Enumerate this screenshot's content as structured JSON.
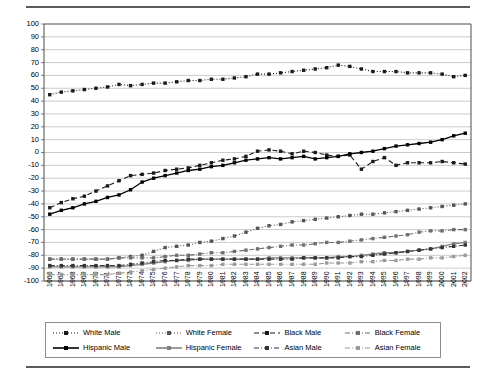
{
  "chart_data": {
    "type": "line",
    "title": "",
    "xlabel": "",
    "ylabel": "",
    "ylim": [
      -100,
      100
    ],
    "ytick_step": 10,
    "grid": true,
    "legend_position": "bottom",
    "marker": "square",
    "categories": [
      "1966",
      "1967",
      "1968",
      "1969",
      "1970",
      "1971",
      "1972",
      "1973",
      "1974",
      "1975",
      "1976",
      "1977",
      "1978",
      "1979",
      "1980",
      "1981",
      "1982",
      "1983",
      "1984",
      "1985",
      "1986",
      "1987",
      "1988",
      "1989",
      "1990",
      "1991",
      "1992",
      "1993",
      "1994",
      "1995",
      "1996",
      "1997",
      "1998",
      "1999",
      "2000",
      "2001",
      "2002"
    ],
    "yticks": [
      "100",
      "90",
      "80",
      "70",
      "60",
      "50",
      "40",
      "30",
      "20",
      "10",
      "0",
      "-10",
      "-20",
      "-30",
      "-40",
      "-50",
      "-60",
      "-70",
      "-80",
      "-90",
      "-100"
    ],
    "series": [
      {
        "name": "White Male",
        "color": "#1a1a1a",
        "dash": "dotted",
        "values": [
          45,
          47,
          48,
          49,
          50,
          51,
          53,
          52,
          53,
          54,
          54,
          55,
          56,
          56,
          57,
          57,
          58,
          59,
          61,
          61,
          62,
          63,
          64,
          65,
          66,
          68,
          67,
          65,
          63,
          63,
          63,
          62,
          62,
          62,
          61,
          59,
          60
        ]
      },
      {
        "name": "White Female",
        "color": "#555555",
        "dash": "dotted",
        "values": [
          -83,
          -83,
          -83,
          -83,
          -83,
          -83,
          -82,
          -81,
          -80,
          -77,
          -74,
          -73,
          -72,
          -70,
          -69,
          -67,
          -65,
          -62,
          -59,
          -57,
          -56,
          -54,
          -53,
          -52,
          -51,
          -50,
          -49,
          -48,
          -48,
          -47,
          -46,
          -45,
          -44,
          -43,
          -42,
          -41,
          -40
        ]
      },
      {
        "name": "Black Male",
        "color": "#1a1a1a",
        "dash": "dashed",
        "values": [
          -43,
          -39,
          -36,
          -34,
          -30,
          -26,
          -22,
          -18,
          -17,
          -16,
          -14,
          -13,
          -12,
          -10,
          -8,
          -6,
          -5,
          -3,
          1,
          2,
          1,
          -1,
          1,
          0,
          -2,
          -3,
          -2,
          -13,
          -7,
          -4,
          -10,
          -8,
          -8,
          -8,
          -7,
          -8,
          -9
        ]
      },
      {
        "name": "Black Female",
        "color": "#6e6e6e",
        "dash": "dashdot",
        "values": [
          -83,
          -83,
          -83,
          -83,
          -83,
          -83,
          -82,
          -82,
          -82,
          -82,
          -81,
          -80,
          -80,
          -79,
          -78,
          -78,
          -77,
          -76,
          -75,
          -74,
          -73,
          -72,
          -72,
          -71,
          -70,
          -70,
          -69,
          -68,
          -67,
          -66,
          -65,
          -64,
          -62,
          -61,
          -61,
          -60,
          -60
        ]
      },
      {
        "name": "Hispanic Male",
        "color": "#000000",
        "dash": "solid",
        "values": [
          -48,
          -45,
          -43,
          -40,
          -38,
          -35,
          -33,
          -29,
          -23,
          -20,
          -18,
          -16,
          -14,
          -13,
          -11,
          -10,
          -8,
          -6,
          -5,
          -4,
          -5,
          -4,
          -3,
          -5,
          -4,
          -3,
          -1,
          0,
          1,
          3,
          5,
          6,
          7,
          8,
          10,
          13,
          15
        ]
      },
      {
        "name": "Hispanic Female",
        "color": "#808080",
        "dash": "solid",
        "values": [
          -89,
          -89,
          -89,
          -89,
          -89,
          -89,
          -89,
          -88,
          -87,
          -86,
          -85,
          -84,
          -84,
          -83,
          -83,
          -83,
          -83,
          -83,
          -83,
          -82,
          -82,
          -82,
          -82,
          -82,
          -82,
          -81,
          -81,
          -80,
          -79,
          -78,
          -78,
          -77,
          -76,
          -75,
          -73,
          -71,
          -70
        ]
      },
      {
        "name": "Asian Male",
        "color": "#333333",
        "dash": "dashdot",
        "values": [
          -88,
          -88,
          -88,
          -88,
          -88,
          -88,
          -88,
          -87,
          -86,
          -85,
          -84,
          -84,
          -83,
          -83,
          -83,
          -83,
          -83,
          -83,
          -83,
          -83,
          -83,
          -83,
          -82,
          -82,
          -82,
          -82,
          -81,
          -81,
          -80,
          -79,
          -78,
          -77,
          -76,
          -75,
          -74,
          -73,
          -72
        ]
      },
      {
        "name": "Asian Female",
        "color": "#9a9a9a",
        "dash": "dashdot",
        "values": [
          -95,
          -95,
          -95,
          -95,
          -95,
          -95,
          -94,
          -93,
          -92,
          -91,
          -90,
          -89,
          -88,
          -88,
          -88,
          -87,
          -87,
          -87,
          -87,
          -87,
          -87,
          -87,
          -87,
          -87,
          -86,
          -86,
          -86,
          -85,
          -85,
          -84,
          -84,
          -83,
          -83,
          -82,
          -82,
          -81,
          -80
        ]
      }
    ]
  }
}
